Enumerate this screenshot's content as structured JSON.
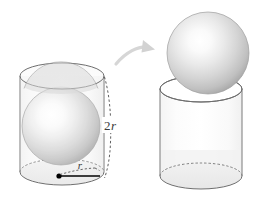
{
  "figure": {
    "name": "sphere-inscribed-in-cylinder",
    "background_color": "#ffffff"
  },
  "labels": {
    "height_label": "2r",
    "height_label_coefficient": "2",
    "height_label_variable": "r",
    "radius_label": "r"
  },
  "left_panel": {
    "name": "cylinder-with-inscribed-sphere",
    "cylinder": {
      "name": "left-cylinder",
      "center_x": 62,
      "top_ellipse_cy": 76,
      "bottom_ellipse_cy": 172,
      "rx": 42,
      "ry": 13,
      "stroke_color": "#7a7a7a",
      "fill_color": "#fbfbfb"
    },
    "sphere": {
      "name": "inscribed-sphere",
      "cx": 61,
      "cy": 126,
      "r": 39,
      "highlight_color": "#ffffff",
      "edge_color": "#9a9a9a"
    },
    "center_dot": {
      "name": "base-center-point",
      "cx": 59,
      "cy": 176,
      "r": 2.6,
      "color": "#000000"
    },
    "radius_arrow": {
      "name": "radius-arrow",
      "from_x": 59,
      "from_y": 176,
      "to_x": 102,
      "to_y": 176,
      "color": "#000000"
    },
    "radius_dashed": {
      "name": "radius-dashed-guide",
      "color": "#555555"
    },
    "height_dashed": {
      "name": "height-dimension-line",
      "x": 104,
      "y_top": 76,
      "y_bottom": 178,
      "color": "#555555"
    }
  },
  "arrow": {
    "name": "transfer-arrow",
    "color": "#d4d4d4",
    "start_x": 115,
    "start_y": 62,
    "end_x": 152,
    "end_y": 58
  },
  "right_panel": {
    "name": "empty-cylinder-with-sphere-on-top",
    "cylinder": {
      "name": "right-cylinder",
      "center_x": 201,
      "top_ellipse_cy": 89,
      "bottom_ellipse_cy": 176,
      "rx": 41,
      "ry": 13,
      "stroke_color": "#7a7a7a",
      "fill_color": "#fdfdfd"
    },
    "sphere": {
      "name": "removed-sphere",
      "cx": 208,
      "cy": 53,
      "r": 41,
      "highlight_color": "#ffffff",
      "edge_color": "#9a9a9a"
    }
  },
  "colors": {
    "sphere_light": "#ffffff",
    "sphere_mid": "#d8d8d8",
    "sphere_dark": "#a8a8a8",
    "cylinder_stroke": "#7a7a7a",
    "cylinder_glass": "#f7f7f7",
    "dash_stroke": "#555555",
    "arrow_gray": "#d4d4d4",
    "label_color": "#3b3b3b"
  }
}
